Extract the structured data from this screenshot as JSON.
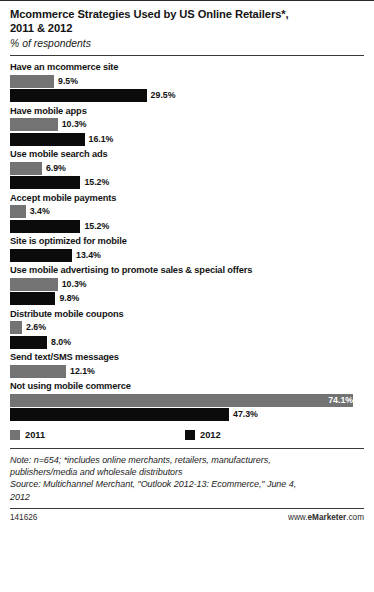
{
  "header": {
    "title": "Mcommerce Strategies Used by US Online Retailers*,\n2011 & 2012",
    "subtitle": "% of respondents"
  },
  "legend": {
    "items": [
      {
        "label": "2011",
        "color": "#737373"
      },
      {
        "label": "2012",
        "color": "#0b0b0b"
      }
    ]
  },
  "footer": {
    "note": "Note: n=654; *includes online merchants, retailers, manufacturers,\npublishers/media and wholesale distributors",
    "source": "Source: Multichannel Merchant, \"Outlook 2012-13: Ecommerce,\" June 4,\n2012",
    "id": "141626",
    "brand_pre": "www.",
    "brand_mid": "eMarketer",
    "brand_post": ".com"
  },
  "chart_data": {
    "type": "bar",
    "orientation": "horizontal",
    "title": "Mcommerce Strategies Used by US Online Retailers*, 2011 & 2012",
    "subtitle": "% of respondents",
    "xlabel": "",
    "ylabel": "",
    "xlim": [
      0,
      74.1
    ],
    "grid": false,
    "legend_position": "bottom",
    "categories": [
      "Have an mcommerce site",
      "Have mobile apps",
      "Use mobile search ads",
      "Accept mobile payments",
      "Site is optimized for mobile",
      "Use mobile advertising to promote sales & special offers",
      "Distribute mobile coupons",
      "Send text/SMS messages",
      "Not using mobile commerce"
    ],
    "series": [
      {
        "name": "2011",
        "color": "#737373",
        "values": [
          9.5,
          10.3,
          6.9,
          3.4,
          null,
          10.3,
          2.6,
          12.1,
          74.1
        ],
        "labels": [
          "9.5%",
          "10.3%",
          "6.9%",
          "3.4%",
          null,
          "10.3%",
          "2.6%",
          "12.1%",
          "74.1%"
        ]
      },
      {
        "name": "2012",
        "color": "#0b0b0b",
        "values": [
          29.5,
          16.1,
          15.2,
          15.2,
          13.4,
          9.8,
          8.0,
          null,
          47.3
        ],
        "labels": [
          "29.5%",
          "16.1%",
          "15.2%",
          "15.2%",
          "13.4%",
          "9.8%",
          "8.0%",
          null,
          "47.3%"
        ]
      }
    ]
  }
}
